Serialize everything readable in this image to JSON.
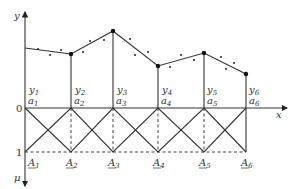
{
  "diagram": {
    "axes": {
      "x_label": "x",
      "y_label": "y",
      "mu_label": "μ",
      "level_0": "0",
      "level_1": "1"
    },
    "columns": [
      {
        "a": "a",
        "a_sub": "1",
        "y": "y",
        "y_sub": "1",
        "A": "A",
        "A_sub": "1"
      },
      {
        "a": "a",
        "a_sub": "2",
        "y": "y",
        "y_sub": "2",
        "A": "A",
        "A_sub": "2"
      },
      {
        "a": "a",
        "a_sub": "3",
        "y": "y",
        "y_sub": "3",
        "A": "A",
        "A_sub": "3"
      },
      {
        "a": "a",
        "a_sub": "4",
        "y": "y",
        "y_sub": "4",
        "A": "A",
        "A_sub": "4"
      },
      {
        "a": "a",
        "a_sub": "5",
        "y": "y",
        "y_sub": "5",
        "A": "A",
        "A_sub": "5"
      },
      {
        "a": "a",
        "a_sub": "6",
        "y": "y",
        "y_sub": "6",
        "A": "A",
        "A_sub": "6"
      }
    ],
    "colors": {
      "line": "#333333",
      "dashed": "#444444"
    }
  }
}
